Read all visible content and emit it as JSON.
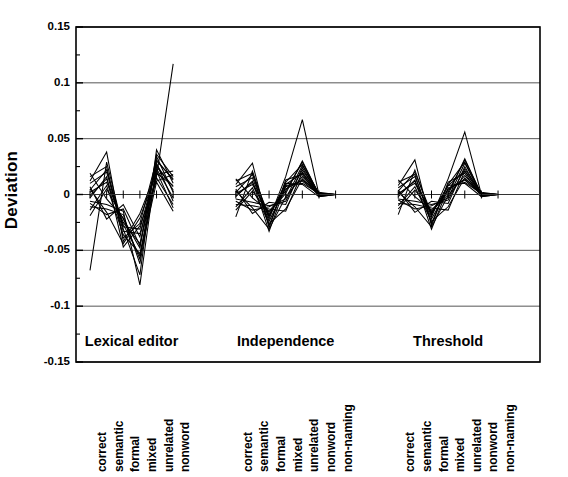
{
  "chart_data": {
    "type": "line",
    "title": "",
    "subtitle": "",
    "xlabel": "",
    "ylabel": "Deviation",
    "ylim": [
      -0.15,
      0.15
    ],
    "yticks": [
      0.15,
      0.1,
      0.05,
      0,
      -0.05,
      -0.1,
      -0.15
    ],
    "ytick_labels": [
      "0.15",
      "0.1",
      "0.05",
      "0",
      "-0.05",
      "-0.1",
      "-0.15"
    ],
    "grid": true,
    "grid_axis": "y",
    "legend": "none",
    "legend_position": "none",
    "line_color": "#000000",
    "axis_color": "#000000",
    "grid_color": "#555555",
    "background": "#ffffff",
    "groups": [
      {
        "name": "Lexical editor",
        "categories": [
          "correct",
          "semantic",
          "formal",
          "mixed",
          "unrelated",
          "nonword"
        ]
      },
      {
        "name": "Independence",
        "categories": [
          "correct",
          "semantic",
          "formal",
          "mixed",
          "unrelated",
          "nonword",
          "non-naming"
        ]
      },
      {
        "name": "Threshold",
        "categories": [
          "correct",
          "semantic",
          "formal",
          "mixed",
          "unrelated",
          "nonword",
          "non-naming"
        ]
      }
    ],
    "categories": [
      "correct",
      "semantic",
      "formal",
      "mixed",
      "unrelated",
      "nonword",
      "correct",
      "semantic",
      "formal",
      "mixed",
      "unrelated",
      "nonword",
      "non-naming",
      "correct",
      "semantic",
      "formal",
      "mixed",
      "unrelated",
      "nonword",
      "non-naming"
    ],
    "series": [
      {
        "name": "case-1",
        "values": [
          0.004,
          0.022,
          -0.029,
          -0.031,
          0.025,
          0.007,
          0.002,
          0.018,
          -0.019,
          0.009,
          0.019,
          0.0,
          0.0,
          0.003,
          0.02,
          -0.017,
          0.008,
          0.021,
          0.0,
          0.0
        ]
      },
      {
        "name": "case-2",
        "values": [
          -0.008,
          -0.018,
          -0.013,
          -0.046,
          0.03,
          0.014,
          -0.006,
          -0.014,
          -0.011,
          -0.004,
          0.026,
          0.001,
          0.0,
          -0.005,
          -0.013,
          -0.01,
          -0.003,
          0.028,
          0.001,
          0.0
        ]
      },
      {
        "name": "case-3",
        "values": [
          0.012,
          0.038,
          -0.042,
          -0.017,
          0.021,
          -0.012,
          0.009,
          0.028,
          -0.03,
          0.013,
          0.018,
          -0.002,
          0.0,
          0.008,
          0.031,
          -0.028,
          0.011,
          0.019,
          -0.002,
          0.0
        ]
      },
      {
        "name": "case-4",
        "values": [
          -0.014,
          0.008,
          -0.036,
          -0.053,
          0.016,
          0.117,
          -0.011,
          0.006,
          -0.026,
          -0.013,
          0.014,
          0.0,
          0.0,
          -0.01,
          0.007,
          -0.024,
          -0.011,
          0.015,
          0.0,
          0.0
        ]
      },
      {
        "name": "case-5",
        "values": [
          0.019,
          -0.004,
          -0.021,
          -0.058,
          0.034,
          0.002,
          0.014,
          -0.003,
          -0.015,
          0.003,
          0.029,
          0.0,
          0.0,
          0.013,
          -0.002,
          -0.014,
          0.002,
          0.031,
          0.0,
          0.0
        ]
      },
      {
        "name": "case-6",
        "values": [
          -0.003,
          0.016,
          -0.047,
          -0.028,
          0.012,
          0.018,
          -0.002,
          0.012,
          -0.033,
          0.008,
          0.01,
          0.001,
          0.0,
          -0.002,
          0.013,
          -0.031,
          0.006,
          0.011,
          0.001,
          0.0
        ]
      },
      {
        "name": "case-7",
        "values": [
          0.007,
          -0.022,
          -0.009,
          -0.038,
          0.028,
          -0.006,
          0.005,
          -0.017,
          -0.007,
          -0.009,
          0.024,
          -0.001,
          0.0,
          0.004,
          -0.016,
          -0.006,
          -0.008,
          0.025,
          -0.001,
          0.0
        ]
      },
      {
        "name": "case-8",
        "values": [
          -0.068,
          0.029,
          -0.031,
          -0.072,
          0.04,
          0.01,
          -0.02,
          0.021,
          -0.022,
          0.016,
          0.067,
          0.0,
          0.0,
          -0.018,
          0.022,
          -0.02,
          0.014,
          0.056,
          0.0,
          0.0
        ]
      },
      {
        "name": "case-9",
        "values": [
          0.002,
          0.011,
          -0.025,
          -0.044,
          0.018,
          0.021,
          0.001,
          0.009,
          -0.018,
          0.005,
          0.013,
          0.002,
          0.0,
          0.001,
          0.01,
          -0.016,
          0.004,
          0.014,
          0.002,
          0.0
        ]
      },
      {
        "name": "case-10",
        "values": [
          -0.011,
          -0.013,
          -0.018,
          -0.062,
          0.023,
          -0.003,
          -0.009,
          -0.01,
          -0.013,
          -0.015,
          0.02,
          0.0,
          0.0,
          -0.008,
          -0.009,
          -0.012,
          -0.014,
          0.021,
          0.0,
          0.0
        ]
      },
      {
        "name": "case-11",
        "values": [
          0.016,
          0.025,
          -0.039,
          -0.026,
          0.031,
          0.013,
          0.012,
          0.019,
          -0.028,
          0.011,
          0.027,
          -0.001,
          0.0,
          0.011,
          0.018,
          -0.026,
          0.009,
          0.029,
          -0.001,
          0.0
        ]
      },
      {
        "name": "case-12",
        "values": [
          -0.006,
          -0.009,
          -0.015,
          -0.081,
          0.027,
          0.004,
          -0.004,
          -0.007,
          -0.01,
          -0.006,
          0.022,
          0.001,
          0.0,
          -0.004,
          -0.006,
          -0.009,
          -0.005,
          0.023,
          0.001,
          0.0
        ]
      },
      {
        "name": "case-13",
        "values": [
          0.01,
          0.02,
          -0.033,
          -0.035,
          0.015,
          -0.009,
          0.007,
          0.015,
          -0.024,
          0.007,
          0.012,
          0.0,
          0.0,
          0.006,
          0.016,
          -0.022,
          0.005,
          0.013,
          0.0,
          0.0
        ]
      },
      {
        "name": "case-14",
        "values": [
          -0.019,
          0.005,
          -0.022,
          -0.048,
          0.036,
          0.016,
          -0.014,
          0.003,
          -0.016,
          0.001,
          0.03,
          0.0,
          0.0,
          -0.013,
          0.004,
          -0.015,
          0.0,
          0.032,
          0.0,
          0.0
        ]
      },
      {
        "name": "case-15",
        "values": [
          0.005,
          -0.016,
          -0.044,
          -0.021,
          0.019,
          0.008,
          0.003,
          -0.012,
          -0.031,
          -0.002,
          0.016,
          0.001,
          0.0,
          0.002,
          -0.011,
          -0.029,
          -0.001,
          0.017,
          0.001,
          0.0
        ]
      },
      {
        "name": "case-16",
        "values": [
          -0.001,
          0.014,
          -0.027,
          -0.055,
          0.011,
          -0.015,
          -0.001,
          0.011,
          -0.02,
          0.01,
          0.009,
          -0.002,
          0.0,
          0.0,
          0.012,
          -0.018,
          0.008,
          0.01,
          -0.002,
          0.0
        ]
      }
    ]
  },
  "axis": {
    "ylabel": "Deviation"
  }
}
